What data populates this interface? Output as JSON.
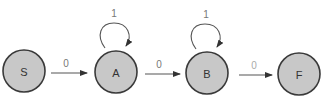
{
  "diagram": {
    "type": "finite-state-automaton",
    "states": [
      {
        "id": "S",
        "label": "S",
        "cx": 24,
        "cy": 71
      },
      {
        "id": "A",
        "label": "A",
        "cx": 116,
        "cy": 72
      },
      {
        "id": "B",
        "label": "B",
        "cx": 207,
        "cy": 73
      },
      {
        "id": "F",
        "label": "F",
        "cx": 299,
        "cy": 74
      }
    ],
    "transitions": [
      {
        "from": "S",
        "to": "A",
        "label": "0"
      },
      {
        "from": "A",
        "to": "A",
        "label": "1"
      },
      {
        "from": "A",
        "to": "B",
        "label": "0"
      },
      {
        "from": "B",
        "to": "B",
        "label": "1"
      },
      {
        "from": "B",
        "to": "F",
        "label": "0"
      }
    ],
    "colors": {
      "state_fill": "#c8c8c8",
      "state_stroke": "#3a3a3a",
      "edge": "#555555",
      "label": "#777777"
    }
  }
}
